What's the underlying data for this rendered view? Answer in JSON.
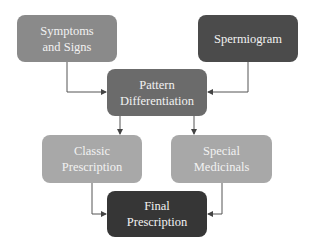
{
  "diagram": {
    "nodes": [
      {
        "id": "symptoms",
        "label": "Symptoms and Signs",
        "lines": [
          "Symptoms",
          "and Signs"
        ],
        "color": "#8a8a8a"
      },
      {
        "id": "spermiogram",
        "label": "Spermiogram",
        "lines": [
          "Spermiogram"
        ],
        "color": "#4b4b4b"
      },
      {
        "id": "pattern",
        "label": "Pattern Differentiation",
        "lines": [
          "Pattern",
          "Differentiation"
        ],
        "color": "#6b6b6b"
      },
      {
        "id": "classic",
        "label": "Classic Prescription",
        "lines": [
          "Classic",
          "Prescription"
        ],
        "color": "#a8a8a8"
      },
      {
        "id": "special",
        "label": "Special Medicinals",
        "lines": [
          "Special",
          "Medicinals"
        ],
        "color": "#a8a8a8"
      },
      {
        "id": "final",
        "label": "Final Prescription",
        "lines": [
          "Final",
          "Prescription"
        ],
        "color": "#363636"
      }
    ],
    "edges": [
      {
        "from": "symptoms",
        "to": "pattern"
      },
      {
        "from": "spermiogram",
        "to": "pattern"
      },
      {
        "from": "pattern",
        "to": "classic"
      },
      {
        "from": "pattern",
        "to": "special"
      },
      {
        "from": "classic",
        "to": "final"
      },
      {
        "from": "special",
        "to": "final"
      }
    ],
    "line_color": "#444444"
  }
}
